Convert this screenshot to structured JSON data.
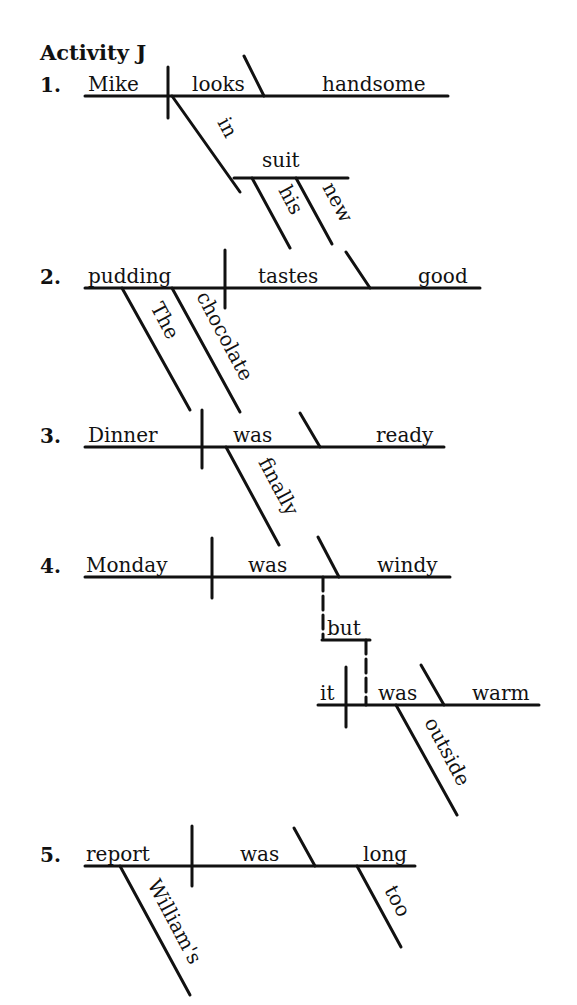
{
  "title": {
    "text": "Activity J",
    "x": 40,
    "y": 60
  },
  "colors": {
    "ink": "#111111",
    "paper": "#ffffff"
  },
  "diagrams": [
    {
      "number": "1.",
      "number_pos": [
        40,
        92
      ],
      "sentence": "Mike looks handsome in his new suit",
      "lines": [
        {
          "type": "base",
          "x1": 85,
          "y1": 96,
          "x2": 448,
          "y2": 96
        },
        {
          "type": "divider",
          "x1": 168,
          "y1": 67,
          "x2": 168,
          "y2": 118
        },
        {
          "type": "slash",
          "x1": 244,
          "y1": 56,
          "x2": 264,
          "y2": 96
        },
        {
          "type": "slant",
          "x1": 172,
          "y1": 96,
          "x2": 240,
          "y2": 192
        },
        {
          "type": "base",
          "x1": 234,
          "y1": 178,
          "x2": 348,
          "y2": 178
        },
        {
          "type": "slant",
          "x1": 252,
          "y1": 178,
          "x2": 290,
          "y2": 248
        },
        {
          "type": "slant",
          "x1": 296,
          "y1": 178,
          "x2": 332,
          "y2": 244
        }
      ],
      "words": [
        {
          "text": "Mike",
          "role": "subject",
          "x": 88,
          "y": 91,
          "rotate": 0,
          "underline": true
        },
        {
          "text": "looks",
          "role": "verb",
          "x": 192,
          "y": 91,
          "rotate": 0
        },
        {
          "text": "handsome",
          "role": "predicate-adjective",
          "x": 322,
          "y": 91,
          "rotate": 0
        },
        {
          "text": "in",
          "role": "preposition",
          "x": 217,
          "y": 122,
          "rotate": 62
        },
        {
          "text": "suit",
          "role": "object-of-preposition",
          "x": 262,
          "y": 167,
          "rotate": 0
        },
        {
          "text": "his",
          "role": "modifier",
          "x": 278,
          "y": 190,
          "rotate": 62
        },
        {
          "text": "new",
          "role": "modifier",
          "x": 322,
          "y": 187,
          "rotate": 62
        }
      ]
    },
    {
      "number": "2.",
      "number_pos": [
        40,
        284
      ],
      "sentence": "The chocolate pudding tastes good",
      "lines": [
        {
          "type": "base",
          "x1": 85,
          "y1": 288,
          "x2": 480,
          "y2": 288
        },
        {
          "type": "divider",
          "x1": 225,
          "y1": 250,
          "x2": 225,
          "y2": 308
        },
        {
          "type": "slash",
          "x1": 346,
          "y1": 252,
          "x2": 370,
          "y2": 288
        },
        {
          "type": "slant",
          "x1": 122,
          "y1": 288,
          "x2": 190,
          "y2": 410
        },
        {
          "type": "slant",
          "x1": 172,
          "y1": 288,
          "x2": 240,
          "y2": 412
        }
      ],
      "words": [
        {
          "text": "pudding",
          "role": "subject",
          "x": 88,
          "y": 283,
          "rotate": 0,
          "underline": true
        },
        {
          "text": "tastes",
          "role": "verb",
          "x": 258,
          "y": 283,
          "rotate": 0
        },
        {
          "text": "good",
          "role": "predicate-adjective",
          "x": 418,
          "y": 283,
          "rotate": 0
        },
        {
          "text": "The",
          "role": "modifier",
          "x": 150,
          "y": 307,
          "rotate": 62
        },
        {
          "text": "chocolate",
          "role": "modifier",
          "x": 196,
          "y": 296,
          "rotate": 62
        }
      ]
    },
    {
      "number": "3.",
      "number_pos": [
        40,
        443
      ],
      "sentence": "Dinner was finally ready",
      "lines": [
        {
          "type": "base",
          "x1": 85,
          "y1": 447,
          "x2": 444,
          "y2": 447
        },
        {
          "type": "divider",
          "x1": 202,
          "y1": 410,
          "x2": 202,
          "y2": 468
        },
        {
          "type": "slash",
          "x1": 300,
          "y1": 413,
          "x2": 320,
          "y2": 447
        },
        {
          "type": "slant",
          "x1": 226,
          "y1": 447,
          "x2": 279,
          "y2": 545
        }
      ],
      "words": [
        {
          "text": "Dinner",
          "role": "subject",
          "x": 88,
          "y": 442,
          "rotate": 0,
          "underline": true
        },
        {
          "text": "was",
          "role": "verb",
          "x": 233,
          "y": 442,
          "rotate": 0
        },
        {
          "text": "ready",
          "role": "predicate-adjective",
          "x": 376,
          "y": 442,
          "rotate": 0
        },
        {
          "text": "finally",
          "role": "adverb",
          "x": 258,
          "y": 462,
          "rotate": 62
        }
      ]
    },
    {
      "number": "4.",
      "number_pos": [
        40,
        573
      ],
      "sentence": "Monday was windy but it was warm outside",
      "lines": [
        {
          "type": "base",
          "x1": 85,
          "y1": 577,
          "x2": 450,
          "y2": 577
        },
        {
          "type": "divider",
          "x1": 212,
          "y1": 538,
          "x2": 212,
          "y2": 598
        },
        {
          "type": "slash",
          "x1": 318,
          "y1": 537,
          "x2": 339,
          "y2": 577
        },
        {
          "type": "dashed",
          "x1": 323,
          "y1": 577,
          "x2": 323,
          "y2": 638
        },
        {
          "type": "base",
          "x1": 322,
          "y1": 640,
          "x2": 370,
          "y2": 640
        },
        {
          "type": "dashed",
          "x1": 366,
          "y1": 640,
          "x2": 366,
          "y2": 705
        },
        {
          "type": "base",
          "x1": 318,
          "y1": 705,
          "x2": 539,
          "y2": 705
        },
        {
          "type": "divider",
          "x1": 346,
          "y1": 667,
          "x2": 346,
          "y2": 727
        },
        {
          "type": "slash",
          "x1": 421,
          "y1": 665,
          "x2": 444,
          "y2": 705
        },
        {
          "type": "slant",
          "x1": 396,
          "y1": 705,
          "x2": 457,
          "y2": 815
        }
      ],
      "words": [
        {
          "text": "Monday",
          "role": "subject",
          "x": 86,
          "y": 572,
          "rotate": 0,
          "underline": true
        },
        {
          "text": "was",
          "role": "verb",
          "x": 248,
          "y": 572,
          "rotate": 0
        },
        {
          "text": "windy",
          "role": "predicate-adjective",
          "x": 377,
          "y": 572,
          "rotate": 0
        },
        {
          "text": "but",
          "role": "conjunction",
          "x": 327,
          "y": 635,
          "rotate": 0
        },
        {
          "text": "it",
          "role": "subject",
          "x": 320,
          "y": 700,
          "rotate": 0
        },
        {
          "text": "was",
          "role": "verb",
          "x": 378,
          "y": 700,
          "rotate": 0
        },
        {
          "text": "warm",
          "role": "predicate-adjective",
          "x": 472,
          "y": 700,
          "rotate": 0
        },
        {
          "text": "outside",
          "role": "adverb",
          "x": 424,
          "y": 722,
          "rotate": 62
        }
      ]
    },
    {
      "number": "5.",
      "number_pos": [
        40,
        862
      ],
      "sentence": "William's report was long too",
      "lines": [
        {
          "type": "base",
          "x1": 85,
          "y1": 866,
          "x2": 415,
          "y2": 866
        },
        {
          "type": "divider",
          "x1": 192,
          "y1": 826,
          "x2": 192,
          "y2": 886
        },
        {
          "type": "slash",
          "x1": 294,
          "y1": 828,
          "x2": 315,
          "y2": 866
        },
        {
          "type": "slant",
          "x1": 120,
          "y1": 866,
          "x2": 190,
          "y2": 995
        },
        {
          "type": "slant",
          "x1": 357,
          "y1": 866,
          "x2": 401,
          "y2": 947
        }
      ],
      "words": [
        {
          "text": "report",
          "role": "subject",
          "x": 86,
          "y": 861,
          "rotate": 0,
          "underline": true
        },
        {
          "text": "was",
          "role": "verb",
          "x": 240,
          "y": 861,
          "rotate": 0
        },
        {
          "text": "long",
          "role": "predicate-adjective",
          "x": 363,
          "y": 861,
          "rotate": 0
        },
        {
          "text": "William's",
          "role": "possessive-modifier",
          "x": 147,
          "y": 884,
          "rotate": 62
        },
        {
          "text": "too",
          "role": "adverb",
          "x": 384,
          "y": 890,
          "rotate": 62
        }
      ]
    }
  ]
}
